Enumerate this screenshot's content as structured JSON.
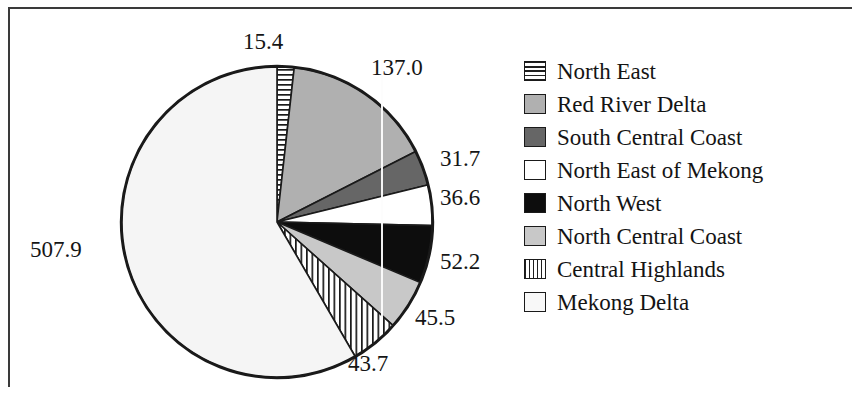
{
  "figure": {
    "background_color": "#ffffff",
    "frame_color": "#3a3a3a"
  },
  "chart_data": {
    "type": "pie",
    "title": "",
    "subtitle": "",
    "xlabel": "",
    "ylabel": "",
    "total": 870.0,
    "start_angle_deg": 0,
    "direction": "clockwise",
    "grid": false,
    "legend_position": "right",
    "categories": [
      "North East",
      "Red River Delta",
      "South Central Coast",
      "North East of Mekong",
      "North West",
      "North Central Coast",
      "Central Highlands",
      "Mekong Delta"
    ],
    "values": [
      15.4,
      137.0,
      31.7,
      36.6,
      52.2,
      45.5,
      43.7,
      507.9
    ],
    "data_labels": [
      "15.4",
      "137.0",
      "31.7",
      "36.6",
      "52.2",
      "45.5",
      "43.7",
      "507.9"
    ],
    "slices": [
      {
        "label": "North East",
        "value": 15.4,
        "text": "15.4",
        "fill": "#ffffff",
        "pattern": "horizontal-stripes",
        "stroke": "#1a1a1a"
      },
      {
        "label": "Red River Delta",
        "value": 137.0,
        "text": "137.0",
        "fill": "#b0b0b0",
        "pattern": "solid",
        "stroke": "#1a1a1a"
      },
      {
        "label": "South Central Coast",
        "value": 31.7,
        "text": "31.7",
        "fill": "#666666",
        "pattern": "solid",
        "stroke": "#1a1a1a"
      },
      {
        "label": "North East of Mekong",
        "value": 36.6,
        "text": "36.6",
        "fill": "#ffffff",
        "pattern": "solid",
        "stroke": "#1a1a1a"
      },
      {
        "label": "North West",
        "value": 52.2,
        "text": "52.2",
        "fill": "#0d0d0d",
        "pattern": "solid",
        "stroke": "#1a1a1a"
      },
      {
        "label": "North Central Coast",
        "value": 45.5,
        "text": "45.5",
        "fill": "#c8c8c8",
        "pattern": "solid",
        "stroke": "#1a1a1a"
      },
      {
        "label": "Central Highlands",
        "value": 43.7,
        "text": "43.7",
        "fill": "#ffffff",
        "pattern": "vertical-stripes",
        "stroke": "#1a1a1a"
      },
      {
        "label": "Mekong Delta",
        "value": 507.9,
        "text": "507.9",
        "fill": "#f5f5f5",
        "pattern": "solid",
        "stroke": "#1a1a1a"
      }
    ]
  },
  "labels": {
    "north_east": "15.4",
    "red_river_delta": "137.0",
    "south_central_coast": "31.7",
    "north_east_of_mekong": "36.6",
    "north_west": "52.2",
    "north_central_coast": "45.5",
    "central_highlands": "43.7",
    "mekong_delta": "507.9"
  },
  "legend": {
    "items": [
      {
        "label": "North East",
        "swatch": "horizontal-stripes",
        "color": "#ffffff"
      },
      {
        "label": "Red River Delta",
        "swatch": "solid",
        "color": "#b0b0b0"
      },
      {
        "label": "South Central Coast",
        "swatch": "solid",
        "color": "#666666"
      },
      {
        "label": "North East of Mekong",
        "swatch": "solid",
        "color": "#ffffff"
      },
      {
        "label": "North West",
        "swatch": "solid",
        "color": "#0d0d0d"
      },
      {
        "label": "North Central Coast",
        "swatch": "solid",
        "color": "#c8c8c8"
      },
      {
        "label": "Central Highlands",
        "swatch": "vertical-stripes",
        "color": "#ffffff"
      },
      {
        "label": "Mekong Delta",
        "swatch": "solid",
        "color": "#f8f8f8"
      }
    ]
  }
}
